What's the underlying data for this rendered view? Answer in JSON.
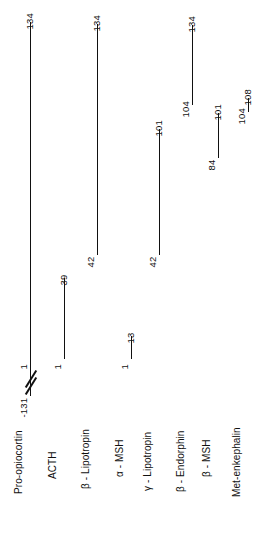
{
  "figure": {
    "line_color": "#111111",
    "background_color": "#ffffff"
  },
  "chart_data": {
    "type": "bar",
    "title": "",
    "xlabel": "",
    "ylabel": "",
    "orientation": "vertical-segments",
    "categories": [
      "Pro-opiocortin",
      "ACTH",
      "β - Lipotropin",
      "α - MSH",
      "γ - Lipotropin",
      "β - Endorphin",
      "β - MSH",
      "Met-enkephalin"
    ],
    "series": [
      {
        "name": "start_residue",
        "values": [
          -131,
          1,
          42,
          1,
          42,
          104,
          84,
          104
        ]
      },
      {
        "name": "end_residue",
        "values": [
          134,
          39,
          134,
          13,
          101,
          134,
          101,
          108
        ]
      }
    ],
    "annotations": [
      "Pro-opiocortin bar drawn with an axis-break (double slash) between residue 1 and -131"
    ]
  },
  "peptides": [
    {
      "name": "Pro-opiocortin",
      "top_label": "134",
      "bottom_label": "1",
      "extra_label": "-131",
      "x": 30,
      "bar_top": 22,
      "bar_bottom": 396,
      "top_label_y": 20,
      "bottom_label_y": 360,
      "extra_label_y": 408,
      "name_label_y": 484,
      "name_label_x": 24,
      "has_break": true,
      "break_y": 378
    },
    {
      "name": "ACTH",
      "top_label": "39",
      "bottom_label": "1",
      "extra_label": "",
      "x": 64,
      "bar_top": 278,
      "bar_bottom": 359,
      "top_label_y": 276,
      "bottom_label_y": 360,
      "name_label_y": 469,
      "name_label_x": 58,
      "has_break": false
    },
    {
      "name": "β - Lipotropin",
      "top_label": "134",
      "bottom_label": "42",
      "extra_label": "",
      "x": 97,
      "bar_top": 24,
      "bar_bottom": 255,
      "top_label_y": 22,
      "bottom_label_y": 258,
      "name_label_y": 479,
      "name_label_x": 91,
      "has_break": false
    },
    {
      "name": "α - MSH",
      "top_label": "13",
      "bottom_label": "1",
      "extra_label": "",
      "x": 131,
      "bar_top": 336,
      "bar_bottom": 359,
      "top_label_y": 334,
      "bottom_label_y": 360,
      "name_label_y": 467,
      "name_label_x": 125,
      "has_break": false
    },
    {
      "name": "γ - Lipotropin",
      "top_label": "101",
      "bottom_label": "42",
      "extra_label": "",
      "x": 159,
      "bar_top": 129,
      "bar_bottom": 255,
      "top_label_y": 127,
      "bottom_label_y": 258,
      "name_label_y": 481,
      "name_label_x": 153,
      "has_break": false
    },
    {
      "name": "β - Endorphin",
      "top_label": "134",
      "bottom_label": "104",
      "extra_label": "",
      "x": 192,
      "bar_top": 25,
      "bar_bottom": 105,
      "top_label_y": 23,
      "bottom_label_y": 108,
      "name_label_y": 482,
      "name_label_x": 186,
      "has_break": false
    },
    {
      "name": "β - MSH",
      "top_label": "101",
      "bottom_label": "84",
      "extra_label": "",
      "x": 218,
      "bar_top": 113,
      "bar_bottom": 158,
      "top_label_y": 111,
      "bottom_label_y": 161,
      "name_label_y": 467,
      "name_label_x": 212,
      "has_break": false
    },
    {
      "name": "Met-enkephalin",
      "top_label": "108",
      "bottom_label": "104",
      "extra_label": "",
      "x": 248,
      "bar_top": 98,
      "bar_bottom": 112,
      "top_label_y": 96,
      "bottom_label_y": 115,
      "name_label_y": 487,
      "name_label_x": 242,
      "has_break": false
    }
  ]
}
